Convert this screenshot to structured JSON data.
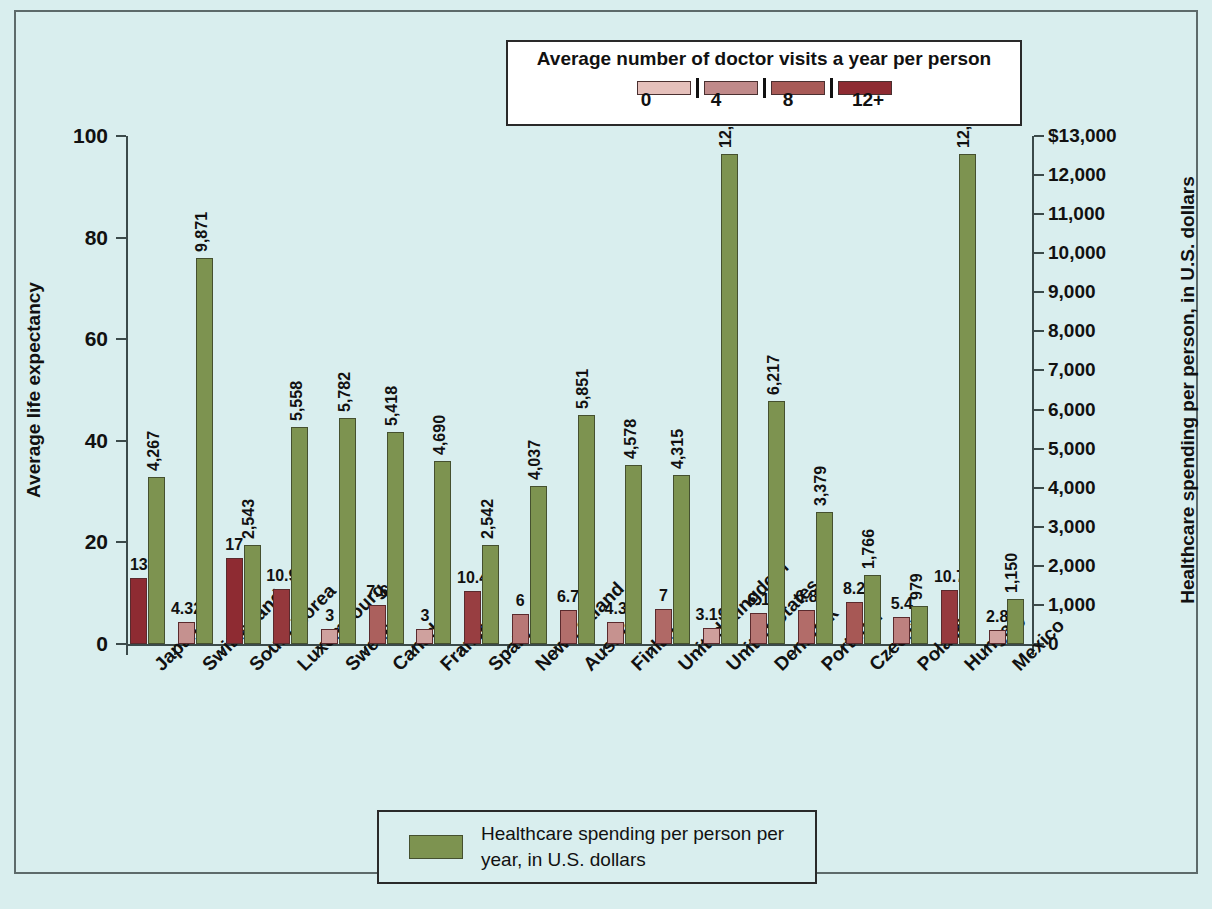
{
  "chart_data": {
    "type": "bar",
    "title": "",
    "categories": [
      "Japan",
      "Switzerland",
      "South Korea",
      "Luxembourg",
      "Sweden",
      "Canada",
      "France",
      "Spain",
      "New Zealand",
      "Austria",
      "Finland",
      "United Kingdom",
      "United States",
      "Denmark",
      "Portugal",
      "Czechia",
      "Poland",
      "Hungary",
      "Mexico"
    ],
    "series": [
      {
        "name": "Average number of doctor visits a year per person",
        "axis": "left-implied",
        "values": [
          13,
          4.32,
          17,
          10.9,
          3,
          7.6,
          3,
          10.4,
          6,
          6.7,
          4.3,
          7,
          3.19,
          6.1,
          6.8,
          8.2,
          5.4,
          10.7,
          2.8
        ],
        "labels": [
          "13",
          "4.32",
          "17",
          "10.9",
          "3",
          "7.6",
          "3",
          "10.4",
          "6",
          "6.7",
          "4.3",
          "7",
          "3.19",
          "6.1",
          "6.8",
          "8.2",
          "5.4",
          "10.7",
          "2.8"
        ]
      },
      {
        "name": "Healthcare spending per person per year, in U.S. dollars",
        "axis": "right",
        "color": "#7d9350",
        "values": [
          4267,
          9871,
          2543,
          5558,
          5782,
          5418,
          4690,
          2542,
          4037,
          5851,
          4578,
          4315,
          12530,
          6217,
          3379,
          1766,
          979,
          12530,
          1150
        ],
        "labels": [
          "4,267",
          "9,871",
          "2,543",
          "5,558",
          "5,782",
          "5,418",
          "4,690",
          "2,542",
          "4,037",
          "5,851",
          "4,578",
          "4,315",
          "12,530",
          "6,217",
          "3,379",
          "1,766",
          "979",
          "12,530",
          "1,150"
        ]
      }
    ],
    "left_axis": {
      "label": "Average life expectancy",
      "ticks": [
        "0",
        "20",
        "40",
        "60",
        "80",
        "100"
      ],
      "values": [
        0,
        20,
        40,
        60,
        80,
        100
      ],
      "lim": [
        0,
        100
      ]
    },
    "right_axis": {
      "label": "Healthcare spending per person, in U.S. dollars",
      "ticks": [
        "0",
        "1,000",
        "2,000",
        "3,000",
        "4,000",
        "5,000",
        "6,000",
        "7,000",
        "8,000",
        "9,000",
        "10,000",
        "11,000",
        "12,000",
        "$13,000"
      ],
      "values": [
        0,
        1000,
        2000,
        3000,
        4000,
        5000,
        6000,
        7000,
        8000,
        9000,
        10000,
        11000,
        12000,
        13000
      ],
      "lim": [
        0,
        13000
      ]
    },
    "xlabel": "",
    "grid": false,
    "legend_position": "top-center and bottom-center"
  },
  "legend_top": {
    "title": "Average number of doctor visits a year per person",
    "ticks": [
      "0",
      "4",
      "8",
      "12+"
    ],
    "swatch_colors": [
      "#e5c0bb",
      "#c08a8a",
      "#a85a57",
      "#8e2b32"
    ]
  },
  "legend_bottom": {
    "label": "Healthcare spending per person per year, in U.S. dollars",
    "swatch_color": "#7d9350"
  },
  "colors": {
    "background": "#d9eeee",
    "frame": "#5d6a6a",
    "spending_green": "#7d9350",
    "visits_lightest": "#e5c0bb",
    "visits_darkest": "#8e2b32",
    "text": "#111111"
  }
}
